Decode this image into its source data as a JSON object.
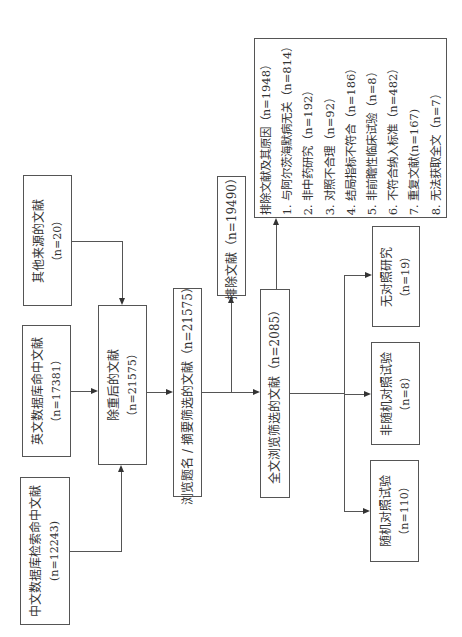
{
  "flowchart": {
    "orientation": "rotated-90-ccw",
    "sources": [
      {
        "id": "other",
        "label": "其他来源的文献",
        "count": "（n=20）"
      },
      {
        "id": "english_db",
        "label": "英文数据库命中文献",
        "count": "（n=17381）"
      },
      {
        "id": "chinese_db",
        "label": "中文数据库检索命中文献",
        "count": "(n=12243)"
      }
    ],
    "dedup": {
      "label": "除重后的文献",
      "count": "（n=21575）"
    },
    "title_abstract": {
      "label": "浏览题名 / 摘要筛选的文献（n=21575）"
    },
    "excluded_first": {
      "label": "排除文献（n=19490）"
    },
    "full_text": {
      "label": "全文浏览筛选的文献（n=2085）"
    },
    "exclusion_reasons": {
      "title": "排除文献及其原因（n=1948）",
      "items": [
        "1. 与阿尔茨海默病无关（n=814）",
        "2. 非中药研究（n=192）",
        "3. 对照不合理（n=92）",
        "4. 结局指标不符合（n=186）",
        "5. 非前瞻性临床试验（n=8）",
        "6. 不符合纳入标准（n=482）",
        "7. 重复文献(n=167)",
        "8. 无法获取全文（n=7）"
      ]
    },
    "outcomes": [
      {
        "id": "no_control",
        "label": "无对照研究",
        "count": "（n=19）"
      },
      {
        "id": "non_rct",
        "label": "非随机对照试验",
        "count": "（n=8）"
      },
      {
        "id": "rct",
        "label": "随机对照试验",
        "count": "（n=110）"
      }
    ]
  }
}
